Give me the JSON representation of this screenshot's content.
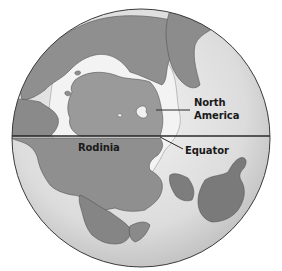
{
  "figure": {
    "type": "globe-diagram",
    "labels": {
      "north_america_line1": "North",
      "north_america_line2": "America",
      "rodinia": "Rodinia",
      "equator": "Equator"
    },
    "colors": {
      "ocean": "#d9d9d9",
      "ocean_light": "#ececec",
      "land": "#8f8f8f",
      "land_dark": "#7a7a7a",
      "shelf": "#f4f4f4",
      "outline": "#3a3a3a",
      "equator_line": "#2a2a2a"
    }
  }
}
